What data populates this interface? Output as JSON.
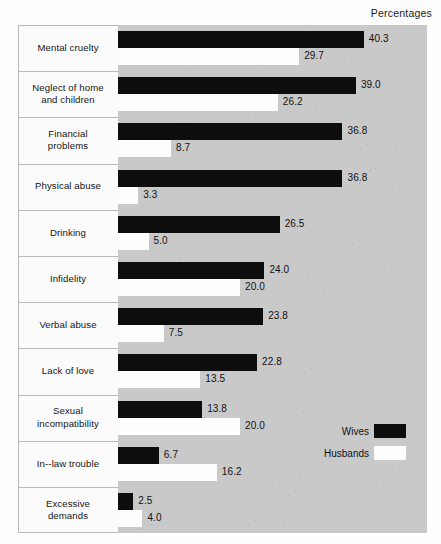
{
  "header": {
    "note": "Percentages"
  },
  "legend": {
    "items": [
      {
        "label": "Wives",
        "color": "#0d0d0d",
        "key": "wives"
      },
      {
        "label": "Husbands",
        "color": "#fdfdfd",
        "key": "husbands"
      }
    ]
  },
  "chart_data": {
    "type": "bar",
    "orientation": "horizontal",
    "title": "",
    "subtitle": "",
    "xlabel": "Percentages",
    "ylabel": "",
    "grid": false,
    "legend_position": "inside-right-lower",
    "xlim": [
      0,
      42
    ],
    "axis_labels_visible": false,
    "categories": [
      "Mental cruelty",
      "Neglect of home and children",
      "Financial problems",
      "Physical abuse",
      "Drinking",
      "Infidelity",
      "Verbal abuse",
      "Lack of love",
      "Sexual incompatibility",
      "In--law trouble",
      "Excessive demands"
    ],
    "category_lines": [
      [
        "Mental cruelty"
      ],
      [
        "Neglect of home",
        "and children"
      ],
      [
        "Financial",
        "problems"
      ],
      [
        "Physical abuse"
      ],
      [
        "Drinking"
      ],
      [
        "Infidelity"
      ],
      [
        "Verbal abuse"
      ],
      [
        "Lack of love"
      ],
      [
        "Sexual",
        "incompatibility"
      ],
      [
        "In--law trouble"
      ],
      [
        "Excessive",
        "demands"
      ]
    ],
    "series": [
      {
        "name": "Wives",
        "color": "#0d0d0d",
        "values": [
          40.3,
          39.0,
          36.8,
          36.8,
          26.5,
          24.0,
          23.8,
          22.8,
          13.8,
          6.7,
          2.5
        ],
        "labels": [
          "40.3",
          "39.0",
          "36.8",
          "36.8",
          "26.5",
          "24.0",
          "23.8",
          "22.8",
          "13.8",
          "6.7",
          "2.5"
        ]
      },
      {
        "name": "Husbands",
        "color": "#fdfdfd",
        "values": [
          29.7,
          26.2,
          8.7,
          3.3,
          5.0,
          20.0,
          7.5,
          13.5,
          20.0,
          16.2,
          4.0
        ],
        "labels": [
          "29.7",
          "26.2",
          "8.7",
          "3.3",
          "5.0",
          "20.0",
          "7.5",
          "13.5",
          "20.0",
          "16.2",
          "4.0"
        ]
      }
    ]
  },
  "style": {
    "plot_background": "#c9c9c9",
    "label_background": "#fbfbfb",
    "page_background": "#fdfdfd",
    "divider_color": "#b9b9b9"
  }
}
